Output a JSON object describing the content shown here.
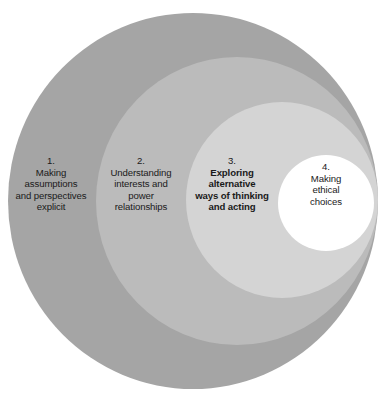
{
  "diagram": {
    "type": "nested-circles",
    "colors": {
      "ring_1": "#a5a5a5",
      "ring_2": "#bbbbbb",
      "ring_3": "#d4d4d4",
      "ring_4": "#ffffff",
      "text": "#1a1a1a",
      "background": "#ffffff"
    },
    "rings": [
      {
        "number": "1.",
        "text": "Making\nassumptions\nand perspectives\nexplicit",
        "lines": [
          "Making",
          "assumptions",
          "and perspectives",
          "explicit"
        ],
        "bold": false,
        "fill": "#a5a5a5"
      },
      {
        "number": "2.",
        "text": "Understanding\ninterests and\npower\nrelationships",
        "lines": [
          "Understanding",
          "interests and",
          "power",
          "relationships"
        ],
        "bold": false,
        "fill": "#bbbbbb"
      },
      {
        "number": "3.",
        "text": "Exploring\nalternative\nways of thinking\nand acting",
        "lines": [
          "Exploring",
          "alternative",
          "ways of thinking",
          "and acting"
        ],
        "bold": true,
        "fill": "#d4d4d4"
      },
      {
        "number": "4.",
        "text": "Making\nethical\nchoices",
        "lines": [
          "Making",
          "ethical",
          "choices"
        ],
        "bold": false,
        "fill": "#ffffff"
      }
    ]
  }
}
